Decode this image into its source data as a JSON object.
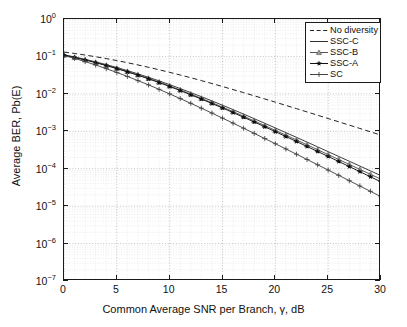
{
  "chart_data": {
    "type": "line",
    "title": "",
    "xlabel": "Common Average SNR per Branch, γ, dB",
    "ylabel": "Average BER, Pb(E)",
    "xlim": [
      0,
      30
    ],
    "ylim": [
      1e-07,
      1
    ],
    "yscale": "log",
    "xscale": "linear",
    "grid": true,
    "legend_position": "upper right",
    "xticks": [
      0,
      5,
      10,
      15,
      20,
      25,
      30
    ],
    "xticklabels": [
      "0",
      "5",
      "10",
      "15",
      "20",
      "25",
      "30"
    ],
    "yticks": [
      1,
      0.1,
      0.01,
      0.001,
      0.0001,
      1e-05,
      1e-06,
      1e-07
    ],
    "yticklabels": [
      "10^0",
      "10^-1",
      "10^-2",
      "10^-3",
      "10^-4",
      "10^-5",
      "10^-6",
      "10^-7"
    ],
    "x": [
      0,
      1,
      2,
      3,
      4,
      5,
      6,
      7,
      8,
      9,
      10,
      11,
      12,
      13,
      14,
      15,
      16,
      17,
      18,
      19,
      20,
      21,
      22,
      23,
      24,
      25,
      26,
      27,
      28,
      29,
      30
    ],
    "series": [
      {
        "name": "No diversity",
        "style": "dashed",
        "marker": "none",
        "color": "#222222",
        "values": [
          0.131,
          0.12,
          0.109,
          0.098,
          0.0875,
          0.0775,
          0.068,
          0.0592,
          0.0512,
          0.044,
          0.0376,
          0.0319,
          0.0269,
          0.0226,
          0.0189,
          0.0157,
          0.013,
          0.0108,
          0.00888,
          0.00731,
          0.006,
          0.00492,
          0.00403,
          0.00329,
          0.00269,
          0.00219,
          0.00179,
          0.00146,
          0.00119,
          0.000968,
          0.000789
        ]
      },
      {
        "name": "SSC-C",
        "style": "solid",
        "marker": "none",
        "color": "#333333",
        "values": [
          0.1105,
          0.0968,
          0.0838,
          0.0716,
          0.0605,
          0.0506,
          0.0418,
          0.0342,
          0.0277,
          0.0222,
          0.0176,
          0.01385,
          0.01082,
          0.0084,
          0.00648,
          0.00497,
          0.00379,
          0.00288,
          0.00217,
          0.001635,
          0.001228,
          0.00092,
          0.000688,
          0.000514,
          0.000383,
          0.0002855,
          0.0002125,
          0.0001582,
          0.0001177,
          8.76e-05,
          6.51e-05
        ]
      },
      {
        "name": "SSC-B",
        "style": "solid",
        "marker": "triangle",
        "color": "#555555",
        "values": [
          0.1085,
          0.0945,
          0.0813,
          0.0691,
          0.058,
          0.0482,
          0.0396,
          0.0322,
          0.0259,
          0.0206,
          0.01625,
          0.0127,
          0.00985,
          0.00759,
          0.00582,
          0.00443,
          0.00336,
          0.00253,
          0.0019,
          0.001422,
          0.001061,
          0.00079,
          0.000587,
          0.000435,
          0.000322,
          0.0002385,
          0.0001763,
          0.0001302,
          9.61e-05,
          7.09e-05,
          5.23e-05
        ]
      },
      {
        "name": "SSC-A",
        "style": "solid",
        "marker": "star",
        "color": "#111111",
        "values": [
          0.1075,
          0.0935,
          0.0803,
          0.0681,
          0.057,
          0.0473,
          0.0387,
          0.0314,
          0.0252,
          0.02,
          0.0157,
          0.01222,
          0.00944,
          0.00725,
          0.00553,
          0.00419,
          0.00316,
          0.00237,
          0.00177,
          0.001317,
          0.000977,
          0.000723,
          0.000534,
          0.000393,
          0.000289,
          0.0002125,
          0.0001559,
          0.0001142,
          8.35e-05,
          6.1e-05,
          4.45e-05
        ]
      },
      {
        "name": "SC",
        "style": "solid",
        "marker": "plus",
        "color": "#444444",
        "values": [
          0.106,
          0.0886,
          0.0728,
          0.059,
          0.0472,
          0.0373,
          0.0292,
          0.0226,
          0.01735,
          0.0132,
          0.00997,
          0.00748,
          0.00558,
          0.00414,
          0.00306,
          0.00225,
          0.00165,
          0.001207,
          0.00088,
          0.00064,
          0.000465,
          0.000337,
          0.000244,
          0.0001765,
          0.0001276,
          9.21e-05,
          6.64e-05,
          4.79e-05,
          3.45e-05,
          2.49e-05,
          1.79e-05
        ]
      }
    ]
  },
  "legend": {
    "items": [
      {
        "label": "No diversity",
        "marker": "dashed-line-swatch"
      },
      {
        "label": "SSC-C",
        "marker": "solid-line-swatch"
      },
      {
        "label": "SSC-B",
        "marker": "triangle-marker-swatch"
      },
      {
        "label": "SSC-A",
        "marker": "star-marker-swatch"
      },
      {
        "label": "SC",
        "marker": "plus-marker-swatch"
      }
    ]
  },
  "axes": {
    "x_title": "Common Average SNR per Branch, γ, dB",
    "y_title": "Average BER, Pb(E)",
    "x_tick_labels": [
      "0",
      "5",
      "10",
      "15",
      "20",
      "25",
      "30"
    ],
    "y_tick_mantissa": "10",
    "y_tick_exponents": [
      "0",
      "-1",
      "-2",
      "-3",
      "-4",
      "-5",
      "-6",
      "-7"
    ]
  }
}
